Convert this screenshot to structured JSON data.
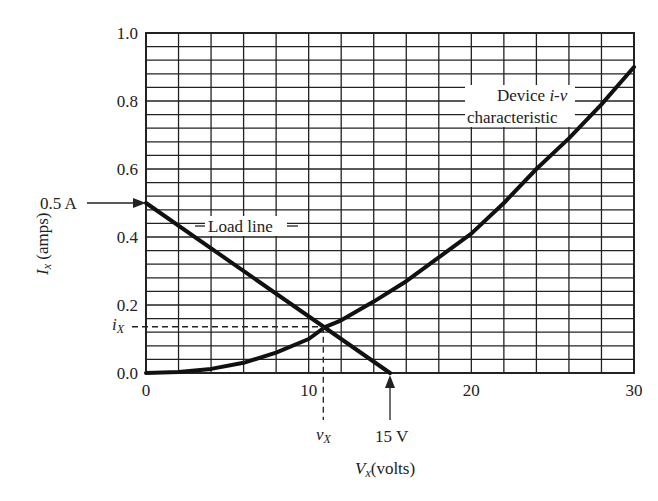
{
  "chart_data": {
    "type": "line",
    "title": "",
    "xlabel": "V_x(volts)",
    "ylabel": "I_x (amps)",
    "xlim": [
      0,
      30
    ],
    "ylim": [
      0,
      1.0
    ],
    "grid": true,
    "grid_spacing": {
      "x": 2,
      "y": 0.04
    },
    "x_ticks": [
      0,
      10,
      20,
      30
    ],
    "x_tick_labels": [
      "0",
      "10",
      "20",
      "30"
    ],
    "y_ticks": [
      0.0,
      0.2,
      0.4,
      0.6,
      0.8,
      1.0
    ],
    "y_tick_labels": [
      "0.0",
      "0.2",
      "0.4",
      "0.6",
      "0.8",
      "1.0"
    ],
    "series": [
      {
        "name": "Load line",
        "x": [
          0,
          15
        ],
        "values": [
          0.5,
          0.0
        ]
      },
      {
        "name": "Device i-v characteristic",
        "x": [
          0,
          2,
          4,
          6,
          8,
          10,
          11,
          12,
          14,
          16,
          18,
          20,
          22,
          24,
          26,
          28,
          30
        ],
        "values": [
          0.0,
          0.003,
          0.012,
          0.03,
          0.06,
          0.1,
          0.135,
          0.155,
          0.21,
          0.27,
          0.34,
          0.41,
          0.5,
          0.6,
          0.69,
          0.79,
          0.9
        ]
      }
    ],
    "operating_point": {
      "v_x": 10.9,
      "i_x": 0.136
    },
    "annotations": [
      {
        "text": "0.5 A",
        "target": [
          0,
          0.5
        ],
        "arrow": "right"
      },
      {
        "text": "15 V",
        "target": [
          15,
          0
        ],
        "arrow": "up"
      },
      {
        "text": "Load line",
        "at": [
          5.5,
          0.41
        ]
      },
      {
        "text": "Device i-v",
        "at": [
          24,
          0.79
        ]
      },
      {
        "text": "characteristic",
        "at": [
          24,
          0.74
        ]
      },
      {
        "text": "i_X",
        "at": "y-axis at operating point"
      },
      {
        "text": "v_X",
        "at": "x-axis at operating point"
      }
    ]
  },
  "labels": {
    "ylabel_main": "I",
    "ylabel_sub": "x",
    "ylabel_rest": " (amps)",
    "xlabel_main": "V",
    "xlabel_sub": "x",
    "xlabel_rest": "(volts)",
    "half_amp": "0.5 A",
    "fifteen_volt": "15 V",
    "load_line": "Load line",
    "device_line1_a": "Device ",
    "device_line1_b": "i-v",
    "device_line2": "characteristic",
    "ix_main": "i",
    "ix_sub": "X",
    "vx_main": "v",
    "vx_sub": "X"
  }
}
